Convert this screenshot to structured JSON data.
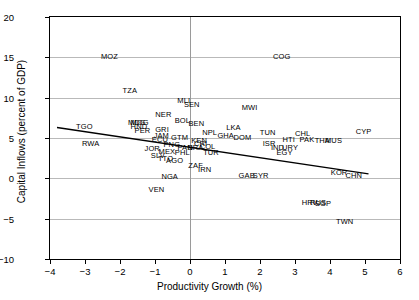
{
  "chart_data": {
    "type": "scatter",
    "title": "",
    "xlabel": "Productivity Growth (%)",
    "ylabel": "Capital Inflows (percent of GDP)",
    "xlim": [
      -4,
      6
    ],
    "ylim": [
      -10,
      20
    ],
    "xticks": [
      -4,
      -3,
      -2,
      -1,
      0,
      1,
      2,
      3,
      4,
      5,
      6
    ],
    "xticklabels": [
      "−4",
      "−3",
      "−2",
      "−1",
      "0",
      "1",
      "2",
      "3",
      "4",
      "5",
      "6"
    ],
    "yticks": [
      -10,
      -5,
      0,
      5,
      10,
      15,
      20
    ],
    "yticklabels": [
      "−10",
      "−5",
      "0",
      "5",
      "10",
      "15",
      "20"
    ],
    "grid": true,
    "legend": false,
    "marker_style": "text-label",
    "points": [
      {
        "label": "MOZ",
        "x": -2.3,
        "y": 15.0
      },
      {
        "label": "TZA",
        "x": -1.72,
        "y": 10.8
      },
      {
        "label": "COG",
        "x": 2.62,
        "y": 15.0
      },
      {
        "label": "MLI",
        "x": -0.18,
        "y": 9.6
      },
      {
        "label": "SEN",
        "x": 0.05,
        "y": 9.1
      },
      {
        "label": "MWI",
        "x": 1.7,
        "y": 8.7
      },
      {
        "label": "NER",
        "x": -0.76,
        "y": 7.8
      },
      {
        "label": "BOL",
        "x": -0.22,
        "y": 7.1
      },
      {
        "label": "BEN",
        "x": 0.18,
        "y": 6.7
      },
      {
        "label": "MDG",
        "x": -1.52,
        "y": 6.9
      },
      {
        "label": "MOG",
        "x": -1.44,
        "y": 6.9
      },
      {
        "label": "HND",
        "x": -1.46,
        "y": 6.4
      },
      {
        "label": "TGO",
        "x": -3.02,
        "y": 6.4
      },
      {
        "label": "PER",
        "x": -1.36,
        "y": 5.9
      },
      {
        "label": "GRI",
        "x": -0.8,
        "y": 6.0
      },
      {
        "label": "CYP",
        "x": 4.96,
        "y": 5.8
      },
      {
        "label": "LKA",
        "x": 1.24,
        "y": 6.2
      },
      {
        "label": "NPL",
        "x": 0.56,
        "y": 5.6
      },
      {
        "label": "GHA",
        "x": 1.02,
        "y": 5.3
      },
      {
        "label": "TUN",
        "x": 2.22,
        "y": 5.6
      },
      {
        "label": "CHL",
        "x": 3.22,
        "y": 5.5
      },
      {
        "label": "GTM",
        "x": -0.3,
        "y": 5.0
      },
      {
        "label": "JAM",
        "x": -0.82,
        "y": 5.2
      },
      {
        "label": "DOM",
        "x": 1.5,
        "y": 5.0
      },
      {
        "label": "PAK",
        "x": 3.34,
        "y": 4.7
      },
      {
        "label": "THA",
        "x": 3.78,
        "y": 4.6
      },
      {
        "label": "MUS",
        "x": 4.1,
        "y": 4.6
      },
      {
        "label": "HTI",
        "x": 2.82,
        "y": 4.7
      },
      {
        "label": "ISR",
        "x": 2.26,
        "y": 4.2
      },
      {
        "label": "RWA",
        "x": -2.84,
        "y": 4.3
      },
      {
        "label": "ECU",
        "x": -0.86,
        "y": 4.8
      },
      {
        "label": "KEN",
        "x": 0.26,
        "y": 4.6
      },
      {
        "label": "CRI",
        "x": 0.3,
        "y": 4.3
      },
      {
        "label": "PNG",
        "x": -0.52,
        "y": 4.1
      },
      {
        "label": "COL",
        "x": 0.5,
        "y": 3.9
      },
      {
        "label": "BRA",
        "x": 0.16,
        "y": 3.8
      },
      {
        "label": "PAN",
        "x": -0.14,
        "y": 3.8
      },
      {
        "label": "JOR",
        "x": -1.08,
        "y": 3.6
      },
      {
        "label": "MEX",
        "x": -0.66,
        "y": 3.3
      },
      {
        "label": "PHL",
        "x": -0.22,
        "y": 3.2
      },
      {
        "label": "TUR",
        "x": 0.6,
        "y": 3.2
      },
      {
        "label": "IND",
        "x": 2.5,
        "y": 3.8
      },
      {
        "label": "URY",
        "x": 2.86,
        "y": 3.8
      },
      {
        "label": "SLV",
        "x": -0.92,
        "y": 2.8
      },
      {
        "label": "TTO",
        "x": -0.7,
        "y": 2.4
      },
      {
        "label": "EGY",
        "x": 2.7,
        "y": 3.1
      },
      {
        "label": "AGO",
        "x": -0.44,
        "y": 2.1
      },
      {
        "label": "ZAF",
        "x": 0.16,
        "y": 1.5
      },
      {
        "label": "IRN",
        "x": 0.42,
        "y": 1.0
      },
      {
        "label": "KOR",
        "x": 4.26,
        "y": 0.7
      },
      {
        "label": "CHN",
        "x": 4.68,
        "y": 0.3
      },
      {
        "label": "NGA",
        "x": -0.58,
        "y": 0.2
      },
      {
        "label": "GAB",
        "x": 1.62,
        "y": 0.3
      },
      {
        "label": "SYR",
        "x": 2.02,
        "y": 0.3
      },
      {
        "label": "VEN",
        "x": -0.96,
        "y": -1.4
      },
      {
        "label": "HRV",
        "x": 3.42,
        "y": -3.0
      },
      {
        "label": "RUS",
        "x": 3.66,
        "y": -3.0
      },
      {
        "label": "SGP",
        "x": 3.8,
        "y": -3.2
      },
      {
        "label": "TWN",
        "x": 4.42,
        "y": -5.4
      }
    ],
    "trend_line": {
      "x_start": -3.8,
      "y_start": 6.3,
      "x_end": 5.1,
      "y_end": 0.55,
      "color": "#000000",
      "width": 1.3
    }
  }
}
